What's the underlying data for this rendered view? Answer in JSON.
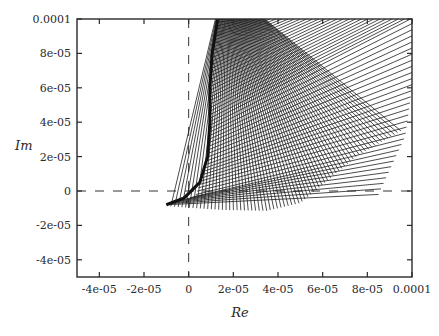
{
  "figure": {
    "xlabel": "Re",
    "ylabel": "Im"
  },
  "chart_data": {
    "type": "line",
    "title": "",
    "xlabel": "Re",
    "ylabel": "Im",
    "xlim": [
      -5e-05,
      0.0001
    ],
    "ylim": [
      -5e-05,
      0.0001
    ],
    "grid": false,
    "legend": null,
    "x_ticks": [
      {
        "value": -4e-05,
        "label": "-4e-05"
      },
      {
        "value": -2e-05,
        "label": "-2e-05"
      },
      {
        "value": 0,
        "label": "0"
      },
      {
        "value": 2e-05,
        "label": "2e-05"
      },
      {
        "value": 4e-05,
        "label": "4e-05"
      },
      {
        "value": 6e-05,
        "label": "6e-05"
      },
      {
        "value": 8e-05,
        "label": "8e-05"
      },
      {
        "value": 0.0001,
        "label": "0.0001"
      }
    ],
    "y_ticks": [
      {
        "value": -4e-05,
        "label": "-4e-05"
      },
      {
        "value": -2e-05,
        "label": "-2e-05"
      },
      {
        "value": 0,
        "label": "0"
      },
      {
        "value": 2e-05,
        "label": "2e-05"
      },
      {
        "value": 4e-05,
        "label": "4e-05"
      },
      {
        "value": 6e-05,
        "label": "6e-05"
      },
      {
        "value": 8e-05,
        "label": "8e-05"
      },
      {
        "value": 0.0001,
        "label": "0.0001"
      }
    ],
    "reference_lines": [
      {
        "orientation": "horizontal",
        "value": 0,
        "style": "dashed"
      },
      {
        "orientation": "vertical",
        "value": 0,
        "style": "dashed"
      }
    ],
    "envelope": {
      "description": "Inner boundary curve of the line family",
      "points": [
        [
          1.3e-05,
          0.0001
        ],
        [
          1.05e-05,
          8e-05
        ],
        [
          9.5e-06,
          6e-05
        ],
        [
          9.5e-06,
          4e-05
        ],
        [
          8.5e-06,
          2e-05
        ],
        [
          5e-06,
          5e-06
        ],
        [
          -2e-06,
          -4e-06
        ],
        [
          -1e-05,
          -8e-06
        ]
      ]
    },
    "line_families": [
      {
        "name": "family-up-right",
        "count": 60,
        "start_curve": [
          [
            -1e-05,
            -8e-06
          ],
          [
            3e-06,
            -3e-06
          ],
          [
            8e-06,
            1.5e-05
          ],
          [
            9.5e-06,
            4e-05
          ],
          [
            1.05e-05,
            8e-05
          ],
          [
            1.3e-05,
            0.0001
          ]
        ],
        "end_curve": [
          [
            8.5e-05,
            -2e-06
          ],
          [
            9.7e-05,
            3.2e-05
          ],
          [
            0.0001,
            6e-05
          ],
          [
            0.0001,
            0.0001
          ],
          [
            4.5e-05,
            0.0001
          ],
          [
            2e-05,
            0.0001
          ]
        ]
      },
      {
        "name": "family-steep",
        "count": 70,
        "start_curve": [
          [
            -8e-06,
            -9e-06
          ],
          [
            1.5e-05,
            -1.1e-05
          ],
          [
            3.5e-05,
            -1.15e-05
          ],
          [
            5e-05,
            -7e-06
          ],
          [
            7.5e-05,
            2e-05
          ],
          [
            9.5e-05,
            3.5e-05
          ]
        ],
        "end_curve": [
          [
            1.2e-05,
            0.0001
          ],
          [
            1.6e-05,
            0.0001
          ],
          [
            2e-05,
            0.0001
          ],
          [
            2.4e-05,
            0.0001
          ],
          [
            2.8e-05,
            0.0001
          ],
          [
            3.4e-05,
            0.0001
          ]
        ]
      }
    ]
  }
}
